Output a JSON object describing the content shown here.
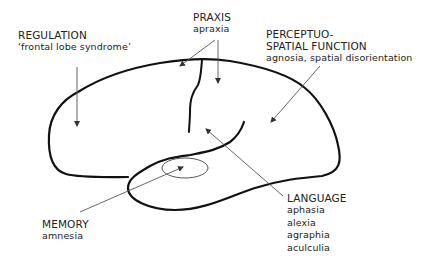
{
  "diagram": {
    "type": "brain-lateral-view-functional-areas",
    "colors": {
      "outline": "#111111",
      "arrow": "#666666",
      "text": "#222222",
      "background": "#ffffff"
    },
    "labels": {
      "regulation": {
        "title": "REGULATION",
        "lines": [
          "‘frontal lobe syndrome’"
        ]
      },
      "praxis": {
        "title": "PRAXIS",
        "lines": [
          "apraxia"
        ]
      },
      "perceptuo_spatial": {
        "title_lines": [
          "PERCEPTUO-",
          "SPATIAL FUNCTION"
        ],
        "lines": [
          "agnosia, spatial disorientation"
        ]
      },
      "language": {
        "title": "LANGUAGE",
        "lines": [
          "aphasia",
          "alexia",
          "agraphia",
          "aculculia"
        ]
      },
      "memory": {
        "title": "MEMORY",
        "lines": [
          "amnesia"
        ]
      }
    }
  }
}
